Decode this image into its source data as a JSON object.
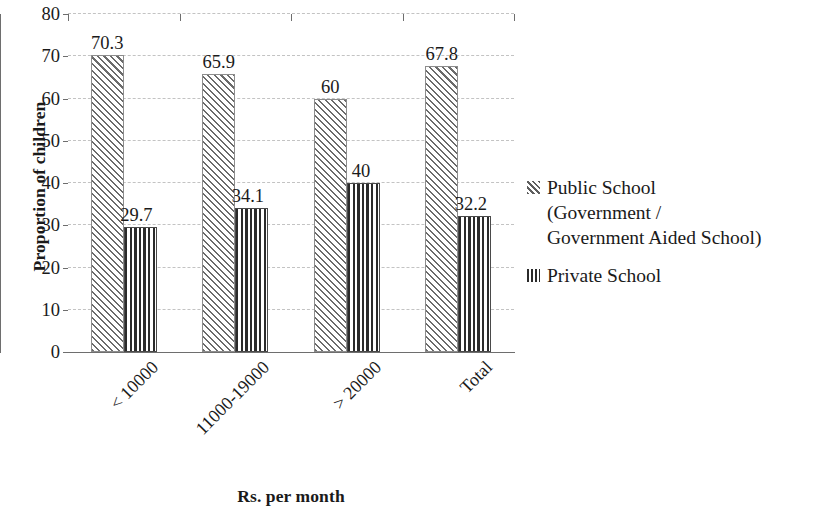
{
  "chart_data": {
    "type": "bar",
    "title": "",
    "xlabel": "Rs. per month",
    "ylabel": "Proportion of children",
    "categories": [
      "< 10000",
      "11000-19000",
      "> 20000",
      "Total"
    ],
    "series": [
      {
        "name": "Public School (Government / Government Aided School)",
        "values": [
          70.3,
          65.9,
          60,
          67.8
        ],
        "value_labels": [
          "70.3",
          "65.9",
          "60",
          "67.8"
        ],
        "pattern": "diagonal-hatch"
      },
      {
        "name": "Private School",
        "values": [
          29.7,
          34.1,
          40,
          32.2
        ],
        "value_labels": [
          "29.7",
          "34.1",
          "40",
          "32.2"
        ],
        "pattern": "vertical-stripe"
      }
    ],
    "ylim": [
      0,
      80
    ],
    "ytick_values": [
      0,
      10,
      20,
      30,
      40,
      50,
      60,
      70,
      80
    ],
    "ytick_labels": [
      "0",
      "10",
      "20",
      "30",
      "40",
      "50",
      "60",
      "70",
      "80"
    ],
    "grid": "horizontal-dashed",
    "legend_position": "right",
    "legend_entries": [
      "Public School (Government / Government Aided School)",
      "Private School"
    ]
  },
  "legend": {
    "public_lines": [
      "Public School",
      "(Government /",
      "Government Aided School)"
    ],
    "private_lines": [
      "Private School"
    ]
  },
  "colors": {
    "axis": "#6e6e6e",
    "gridline": "#c3c3c3",
    "text": "#1a1a1a",
    "public_hatch": "#6b6b6b",
    "private_stripe": "#2b2b2b",
    "background": "#ffffff"
  }
}
